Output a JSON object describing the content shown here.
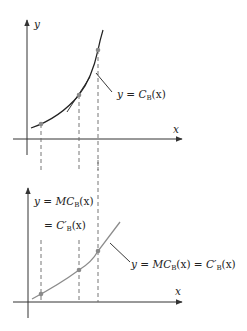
{
  "top_panel": {
    "y_axis_label": "y",
    "x_axis_label": "x",
    "curve_label": {
      "prefix": "y = ",
      "func": "C",
      "sub": "B",
      "arg": "(x)"
    }
  },
  "bottom_panel": {
    "y_axis_label_line1": {
      "prefix": "y = ",
      "func": "MC",
      "sub": "B",
      "arg": "(x)"
    },
    "y_axis_label_line2": {
      "prefix": "= ",
      "func": "C′",
      "sub": "B",
      "arg": "(x)"
    },
    "x_axis_label": "x",
    "curve_label": {
      "prefix": "y = ",
      "func": "MC",
      "sub": "B",
      "arg": "(x) = ",
      "func2": "C′",
      "sub2": "B",
      "arg2": "(x)"
    }
  },
  "colors": {
    "axis": "#333333",
    "top_curve": "#222222",
    "bottom_curve": "#8c8c8c",
    "points": "#8a8a8a",
    "dashes": "#666666"
  }
}
